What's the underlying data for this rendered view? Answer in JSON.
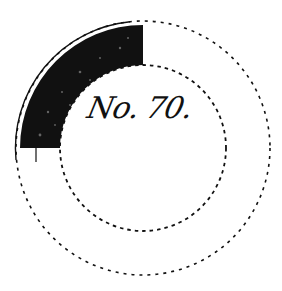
{
  "figure": {
    "label": "No. 70.",
    "colors": {
      "ink": "#111111",
      "background": "#ffffff"
    },
    "rings": {
      "center": [
        143,
        148
      ],
      "outer_radius": 127,
      "inner_radius": 83,
      "style": "dashed"
    },
    "filled_sector": {
      "start_angle_deg": 180,
      "end_angle_deg": 270,
      "description": "quarter annulus, upper-left"
    }
  }
}
